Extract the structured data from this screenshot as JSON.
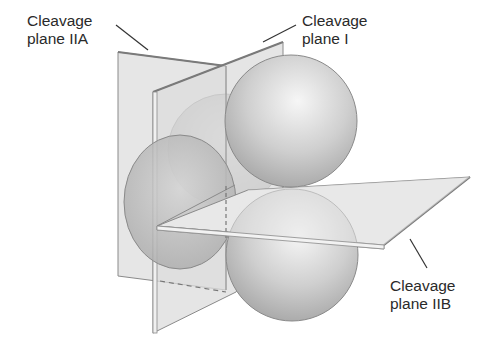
{
  "labels": {
    "plane_iia": {
      "line1": "Cleavage",
      "line2": "plane IIA"
    },
    "plane_i": {
      "line1": "Cleavage",
      "line2": "plane I"
    },
    "plane_iib": {
      "line1": "Cleavage",
      "line2": "plane IIB"
    }
  },
  "colors": {
    "plane_fill": "#e4e4e4",
    "plane_edge": "#8a8a8a",
    "sphere_light": "#f4f4f4",
    "sphere_dark": "#a9a9a9",
    "text": "#2a2a2a"
  }
}
